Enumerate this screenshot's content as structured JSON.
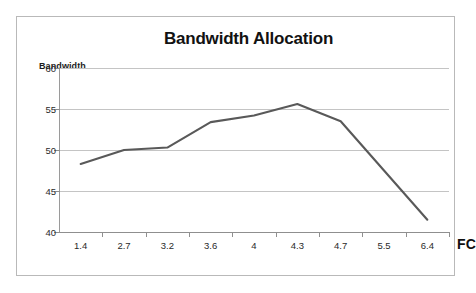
{
  "chart_data": {
    "type": "line",
    "title": "Bandwidth Allocation",
    "xlabel": "FC",
    "ylabel": "Bandwidth",
    "categories": [
      "1.4",
      "2.7",
      "3.2",
      "3.6",
      "4",
      "4.3",
      "4.7",
      "5.5",
      "6.4"
    ],
    "values": [
      48.3,
      50.0,
      50.3,
      53.4,
      54.2,
      55.6,
      53.5,
      47.5,
      41.5
    ],
    "series": [
      {
        "name": "Bandwidth",
        "values": [
          48.3,
          50.0,
          50.3,
          53.4,
          54.2,
          55.6,
          53.5,
          47.5,
          41.5
        ],
        "color": "#595959"
      }
    ],
    "ylim": [
      40,
      60
    ],
    "y_ticks": [
      "40",
      "45",
      "50",
      "55",
      "60"
    ],
    "y_tick_values": [
      40,
      45,
      50,
      55,
      60
    ],
    "grid": true,
    "legend": false,
    "legend_position": "none",
    "markers": false
  },
  "axes": {
    "y_title": "Bandwidth",
    "x_title": "FC",
    "y_tick_labels": [
      "60",
      "55",
      "50",
      "45",
      "40"
    ],
    "x_tick_labels": [
      "1.4",
      "2.7",
      "3.2",
      "3.6",
      "4",
      "4.3",
      "4.7",
      "5.5",
      "6.4"
    ]
  },
  "colors": {
    "series_line": "#595959",
    "gridline": "#c4c4c4",
    "axis": "#8f8f8f",
    "frame": "#b9b9b9",
    "text": "#1a1a1a",
    "background": "#ffffff"
  }
}
